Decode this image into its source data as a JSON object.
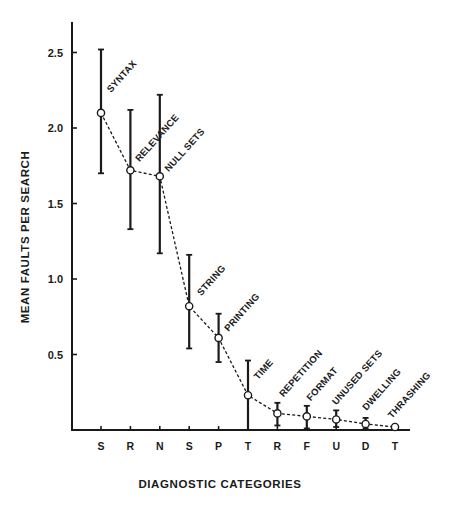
{
  "chart_data": {
    "type": "line",
    "title": "",
    "xlabel": "DIAGNOSTIC CATEGORIES",
    "ylabel": "MEAN FAULTS PER SEARCH",
    "ylim": [
      0,
      2.7
    ],
    "yticks": [
      0.5,
      1.0,
      1.5,
      2.0,
      2.5
    ],
    "ytick_labels": [
      "0.5",
      "1.0",
      "1.5",
      "2.0",
      "2.5"
    ],
    "grid": false,
    "legend": "none",
    "line_style": "dashed",
    "marker": "open-circle",
    "error_bars": true,
    "categories": [
      "S",
      "R",
      "N",
      "S",
      "P",
      "T",
      "R",
      "F",
      "U",
      "D",
      "T"
    ],
    "annotations": [
      "SYNTAX",
      "RELEVANCE",
      "NULL SETS",
      "STRING",
      "PRINTING",
      "TIME",
      "REPETITION",
      "FORMAT",
      "UNUSED SETS",
      "DWELLING",
      "THRASHING"
    ],
    "series": [
      {
        "name": "Mean faults per search",
        "values": [
          2.1,
          1.72,
          1.68,
          0.82,
          0.61,
          0.23,
          0.11,
          0.09,
          0.07,
          0.04,
          0.02
        ],
        "error_upper": [
          2.52,
          2.12,
          2.22,
          1.16,
          0.77,
          0.46,
          0.18,
          0.16,
          0.13,
          0.08,
          0.03
        ],
        "error_lower": [
          1.7,
          1.33,
          1.17,
          0.54,
          0.45,
          0.0,
          0.03,
          0.01,
          0.02,
          0.01,
          0.01
        ]
      }
    ]
  }
}
